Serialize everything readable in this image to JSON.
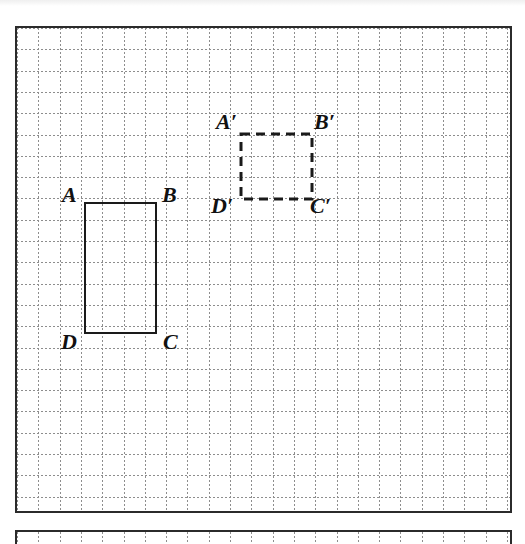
{
  "figure": {
    "type": "geometry-diagram",
    "background_color": "#ffffff",
    "frame": {
      "border_color": "#2b2b2b",
      "x": 15,
      "y": 26,
      "width": 497,
      "height": 487
    },
    "grid": {
      "cell_size": 21.3,
      "line_color": "#8d8d8d",
      "style": "dotted",
      "columns": 23,
      "rows": 22
    },
    "shapes": [
      {
        "id": "rect-abcd",
        "name": "Rectangle ABCD",
        "style": "solid",
        "stroke_color": "#1a1a1a",
        "x": 84,
        "y": 202,
        "width": 73,
        "height": 132,
        "width_cells": 3.5,
        "height_cells": 6,
        "vertices": [
          {
            "key": "A",
            "label": "A",
            "prime": "",
            "corner": "top-left",
            "label_x": 62,
            "label_y": 184
          },
          {
            "key": "B",
            "label": "B",
            "prime": "",
            "corner": "top-right",
            "label_x": 162,
            "label_y": 184
          },
          {
            "key": "C",
            "label": "C",
            "prime": "",
            "corner": "bottom-right",
            "label_x": 163,
            "label_y": 331
          },
          {
            "key": "D",
            "label": "D",
            "prime": "",
            "corner": "bottom-left",
            "label_x": 61,
            "label_y": 331
          }
        ]
      },
      {
        "id": "rect-abcd-prime",
        "name": "Square A'B'C'D'",
        "style": "dashed",
        "stroke_color": "#1a1a1a",
        "x": 241,
        "y": 134,
        "width": 71,
        "height": 65,
        "width_cells": 3.33,
        "height_cells": 3,
        "vertices": [
          {
            "key": "Ap",
            "label": "A",
            "prime": "′",
            "corner": "top-left",
            "label_x": 216,
            "label_y": 111
          },
          {
            "key": "Bp",
            "label": "B",
            "prime": "′",
            "corner": "top-right",
            "label_x": 314,
            "label_y": 111
          },
          {
            "key": "Cp",
            "label": "C",
            "prime": "′",
            "corner": "bottom-right",
            "label_x": 310,
            "label_y": 195
          },
          {
            "key": "Dp",
            "label": "D",
            "prime": "′",
            "corner": "bottom-left",
            "label_x": 211,
            "label_y": 195
          }
        ]
      }
    ],
    "bottom_panel": {
      "x": 15,
      "y": 530,
      "width": 497,
      "height": 14,
      "border_color": "#2b2b2b"
    }
  }
}
